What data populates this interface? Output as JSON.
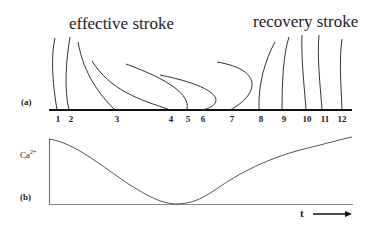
{
  "panel_a": {
    "tag": "(a)",
    "effective_label": "effective stroke",
    "recovery_label": "recovery stroke",
    "positions": [
      {
        "label": "1",
        "x": 58
      },
      {
        "label": "2",
        "x": 69
      },
      {
        "label": "3",
        "x": 116
      },
      {
        "label": "4",
        "x": 171
      },
      {
        "label": "5",
        "x": 188
      },
      {
        "label": "6",
        "x": 203
      },
      {
        "label": "7",
        "x": 232
      },
      {
        "label": "8",
        "x": 260
      },
      {
        "label": "9",
        "x": 283
      },
      {
        "label": "10",
        "x": 307
      },
      {
        "label": "11",
        "x": 324
      },
      {
        "label": "12",
        "x": 342
      }
    ]
  },
  "panel_b": {
    "tag": "(b)",
    "y_label": "Ca",
    "y_label_sup": "2+",
    "x_label": "t",
    "arrow": "right-arrow"
  },
  "colors": {
    "line": "#333333",
    "baseline": "#111111",
    "curve": "#555555"
  }
}
